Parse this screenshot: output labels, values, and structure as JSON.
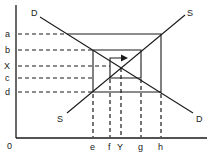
{
  "diagram": {
    "origin_label": "0",
    "y_axis_labels": [
      {
        "id": "a",
        "text": "a",
        "y": 34
      },
      {
        "id": "b",
        "text": "b",
        "y": 50
      },
      {
        "id": "X",
        "text": "X",
        "y": 66
      },
      {
        "id": "c",
        "text": "c",
        "y": 78
      },
      {
        "id": "d",
        "text": "d",
        "y": 92
      }
    ],
    "x_axis_labels": [
      {
        "id": "e",
        "text": "e",
        "x": 93
      },
      {
        "id": "f",
        "text": "f",
        "x": 110
      },
      {
        "id": "Y",
        "text": "Y",
        "x": 121
      },
      {
        "id": "g",
        "text": "g",
        "x": 141
      },
      {
        "id": "h",
        "text": "h",
        "x": 161
      }
    ],
    "curves": {
      "demand_label_top": "D",
      "demand_label_bottom": "D",
      "supply_label_top": "S",
      "supply_label_bottom": "S"
    },
    "colors": {
      "line": "#1a1a1a",
      "background": "#ffffff"
    }
  }
}
